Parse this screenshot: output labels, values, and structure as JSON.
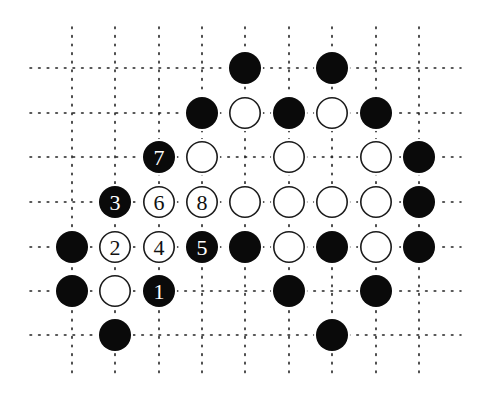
{
  "diagram": {
    "type": "go-board-diagram",
    "colors": {
      "background": "#ffffff",
      "grid": "#222222",
      "black_stone": "#0a0a0a",
      "white_stone_fill": "#ffffff",
      "white_stone_stroke": "#1a1a1a"
    },
    "grid": {
      "cols_x": [
        72,
        115,
        159,
        202,
        245,
        289,
        332,
        376,
        419
      ],
      "rows_y": [
        68,
        113,
        157,
        202,
        247,
        291,
        335
      ],
      "h_extent": [
        30,
        461
      ],
      "v_extent": [
        27,
        378
      ],
      "stone_radius": 16
    },
    "stones": [
      {
        "row": 0,
        "col": 4,
        "color": "black",
        "label": ""
      },
      {
        "row": 0,
        "col": 6,
        "color": "black",
        "label": ""
      },
      {
        "row": 1,
        "col": 3,
        "color": "black",
        "label": ""
      },
      {
        "row": 1,
        "col": 4,
        "color": "white",
        "label": ""
      },
      {
        "row": 1,
        "col": 5,
        "color": "black",
        "label": ""
      },
      {
        "row": 1,
        "col": 6,
        "color": "white",
        "label": ""
      },
      {
        "row": 1,
        "col": 7,
        "color": "black",
        "label": ""
      },
      {
        "row": 2,
        "col": 2,
        "color": "black",
        "label": "7"
      },
      {
        "row": 2,
        "col": 3,
        "color": "white",
        "label": ""
      },
      {
        "row": 2,
        "col": 5,
        "color": "white",
        "label": ""
      },
      {
        "row": 2,
        "col": 7,
        "color": "white",
        "label": ""
      },
      {
        "row": 2,
        "col": 8,
        "color": "black",
        "label": ""
      },
      {
        "row": 3,
        "col": 1,
        "color": "black",
        "label": "3"
      },
      {
        "row": 3,
        "col": 2,
        "color": "white",
        "label": "6"
      },
      {
        "row": 3,
        "col": 3,
        "color": "white",
        "label": "8"
      },
      {
        "row": 3,
        "col": 4,
        "color": "white",
        "label": ""
      },
      {
        "row": 3,
        "col": 5,
        "color": "white",
        "label": ""
      },
      {
        "row": 3,
        "col": 6,
        "color": "white",
        "label": ""
      },
      {
        "row": 3,
        "col": 7,
        "color": "white",
        "label": ""
      },
      {
        "row": 3,
        "col": 8,
        "color": "black",
        "label": ""
      },
      {
        "row": 4,
        "col": 0,
        "color": "black",
        "label": ""
      },
      {
        "row": 4,
        "col": 1,
        "color": "white",
        "label": "2"
      },
      {
        "row": 4,
        "col": 2,
        "color": "white",
        "label": "4"
      },
      {
        "row": 4,
        "col": 3,
        "color": "black",
        "label": "5"
      },
      {
        "row": 4,
        "col": 4,
        "color": "black",
        "label": ""
      },
      {
        "row": 4,
        "col": 5,
        "color": "white",
        "label": ""
      },
      {
        "row": 4,
        "col": 6,
        "color": "black",
        "label": ""
      },
      {
        "row": 4,
        "col": 7,
        "color": "white",
        "label": ""
      },
      {
        "row": 4,
        "col": 8,
        "color": "black",
        "label": ""
      },
      {
        "row": 5,
        "col": 0,
        "color": "black",
        "label": ""
      },
      {
        "row": 5,
        "col": 1,
        "color": "white",
        "label": ""
      },
      {
        "row": 5,
        "col": 2,
        "color": "black",
        "label": "1"
      },
      {
        "row": 5,
        "col": 5,
        "color": "black",
        "label": ""
      },
      {
        "row": 5,
        "col": 7,
        "color": "black",
        "label": ""
      },
      {
        "row": 6,
        "col": 1,
        "color": "black",
        "label": ""
      },
      {
        "row": 6,
        "col": 6,
        "color": "black",
        "label": ""
      }
    ]
  }
}
